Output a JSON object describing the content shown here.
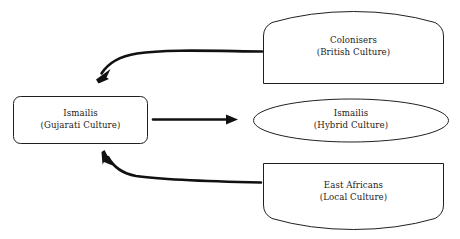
{
  "diagram": {
    "type": "flow-diagram",
    "background_color": "#ffffff",
    "stroke_color": "#231f20",
    "arrow_color": "#111111",
    "nodes": [
      {
        "id": "colonisers",
        "shape": "dome-up",
        "line_primary": "Colonisers",
        "line_secondary": "(British Culture)",
        "position": "top-right"
      },
      {
        "id": "ismailis-source",
        "shape": "rounded-rectangle",
        "line_primary": "Ismailis",
        "line_secondary": "(Gujarati Culture)",
        "position": "middle-left"
      },
      {
        "id": "ismailis-hybrid",
        "shape": "ellipse",
        "line_primary": "Ismailis",
        "line_secondary": "(Hybrid Culture)",
        "position": "middle-right"
      },
      {
        "id": "east-africans",
        "shape": "dome-down",
        "line_primary": "East Africans",
        "line_secondary": "(Local Culture)",
        "position": "bottom-right"
      }
    ],
    "connectors": [
      {
        "id": "colonisers-to-ismailis",
        "style": "curved",
        "from": "colonisers",
        "to": "ismailis-source",
        "direction": "right-to-left-down",
        "label": ""
      },
      {
        "id": "ismailis-to-hybrid",
        "style": "straight",
        "from": "ismailis-source",
        "to": "ismailis-hybrid",
        "direction": "left-to-right",
        "label": ""
      },
      {
        "id": "east-africans-to-ismailis",
        "style": "curved",
        "from": "east-africans",
        "to": "ismailis-source",
        "direction": "right-to-left-up",
        "label": ""
      }
    ]
  }
}
